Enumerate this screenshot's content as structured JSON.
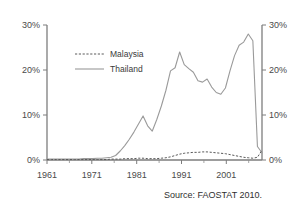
{
  "chart_data": {
    "type": "line",
    "title": "",
    "xlabel": "",
    "ylabel": "",
    "xlim": [
      1961,
      2008
    ],
    "ylim": [
      0,
      30
    ],
    "grid": false,
    "legend_position": "upper-left-inside",
    "y_axis_left": {
      "ticks": [
        0,
        10,
        20,
        30
      ],
      "tick_labels": [
        "0%",
        "10%",
        "20%",
        "30%"
      ]
    },
    "y_axis_right": {
      "ticks": [
        0,
        10,
        20,
        30
      ],
      "tick_labels": [
        "0%",
        "10%",
        "20%",
        "30%"
      ]
    },
    "x_axis": {
      "major_ticks": [
        1961,
        1971,
        1981,
        1991,
        2001
      ],
      "major_tick_labels": [
        "1961",
        "1971",
        "1981",
        "1991",
        "2001"
      ],
      "minor_ticks": [
        1966,
        1976,
        1986,
        1996,
        2006
      ]
    },
    "x": [
      1961,
      1962,
      1963,
      1964,
      1965,
      1966,
      1967,
      1968,
      1969,
      1970,
      1971,
      1972,
      1973,
      1974,
      1975,
      1976,
      1977,
      1978,
      1979,
      1980,
      1981,
      1982,
      1983,
      1984,
      1985,
      1986,
      1987,
      1988,
      1989,
      1990,
      1991,
      1992,
      1993,
      1994,
      1995,
      1996,
      1997,
      1998,
      1999,
      2000,
      2001,
      2002,
      2003,
      2004,
      2005,
      2006,
      2007,
      2008
    ],
    "series": [
      {
        "name": "Malaysia",
        "style": "dashed",
        "color": "#5a5a5a",
        "values": [
          0.1,
          0.1,
          0.1,
          0.1,
          0.1,
          0.1,
          0.1,
          0.1,
          0.1,
          0.1,
          0.1,
          0.1,
          0.1,
          0.1,
          0.2,
          0.2,
          0.2,
          0.3,
          0.3,
          0.3,
          0.4,
          0.4,
          0.3,
          0.3,
          0.3,
          0.4,
          0.5,
          0.7,
          1.0,
          1.3,
          1.5,
          1.6,
          1.7,
          1.7,
          1.8,
          1.8,
          1.7,
          1.6,
          1.5,
          1.4,
          1.2,
          1.0,
          0.8,
          0.6,
          0.5,
          0.4,
          0.6,
          2.2
        ]
      },
      {
        "name": "Thailand",
        "style": "solid",
        "color": "#9a9a9a",
        "values": [
          0.2,
          0.2,
          0.2,
          0.2,
          0.2,
          0.2,
          0.2,
          0.2,
          0.3,
          0.3,
          0.3,
          0.4,
          0.4,
          0.5,
          0.6,
          1.0,
          2.0,
          3.2,
          4.6,
          6.2,
          8.0,
          9.8,
          7.6,
          6.4,
          9.0,
          12.0,
          15.5,
          19.8,
          20.5,
          24.0,
          21.2,
          20.3,
          19.5,
          17.6,
          17.3,
          18.0,
          16.2,
          15.0,
          14.6,
          16.0,
          19.8,
          23.2,
          25.5,
          26.2,
          28.0,
          26.5,
          3.0,
          1.6
        ]
      }
    ]
  },
  "legend": {
    "items": [
      {
        "label": "Malaysia"
      },
      {
        "label": "Thailand"
      }
    ]
  },
  "footer": {
    "source": "Source: FAOSTAT 2010."
  }
}
